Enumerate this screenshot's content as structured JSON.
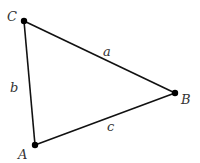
{
  "diagram": {
    "type": "triangle",
    "vertices": [
      {
        "name": "A",
        "label": "A",
        "x": 35,
        "y": 145
      },
      {
        "name": "B",
        "label": "B",
        "x": 175,
        "y": 93
      },
      {
        "name": "C",
        "label": "C",
        "x": 24,
        "y": 21
      }
    ],
    "sides": [
      {
        "name": "a",
        "label": "a",
        "from": "C",
        "to": "B"
      },
      {
        "name": "b",
        "label": "b",
        "from": "C",
        "to": "A"
      },
      {
        "name": "c",
        "label": "c",
        "from": "A",
        "to": "B"
      }
    ],
    "colors": {
      "line": "#111111",
      "vertex": "#000000",
      "label": "#333333"
    }
  }
}
